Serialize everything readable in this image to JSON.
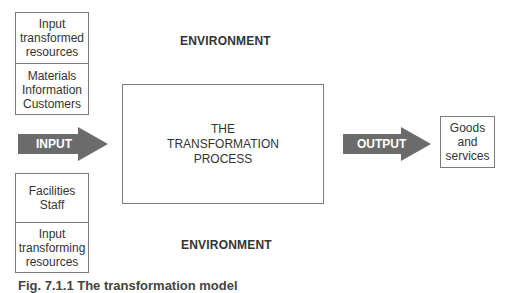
{
  "diagram": {
    "top_left_box": {
      "header": "Input\ntransformed\nresources",
      "items": "Materials\nInformation\nCustomers"
    },
    "bottom_left_box": {
      "items": "Facilities\nStaff",
      "footer": "Input\ntransforming\nresources"
    },
    "environment_top": "ENVIRONMENT",
    "environment_bottom": "ENVIRONMENT",
    "process_box": "THE\nTRANSFORMATION\nPROCESS",
    "input_arrow": "INPUT",
    "output_arrow": "OUTPUT",
    "output_box": "Goods\nand\nservices",
    "arrow_color": "#6b6b6b",
    "caption": "Fig. 7.1.1 The transformation model"
  }
}
